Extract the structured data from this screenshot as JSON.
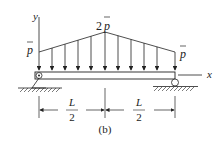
{
  "figure": {
    "caption": "(b)",
    "axes": {
      "y_label": "y",
      "x_label": "x"
    },
    "loads": {
      "left_label": "p",
      "peak_label_coef": "2",
      "peak_label_var": "p",
      "right_label": "p"
    },
    "dimensions": [
      {
        "num": "L",
        "den": "2"
      },
      {
        "num": "L",
        "den": "2"
      }
    ],
    "supports": {
      "left": "pin",
      "right": "roller"
    },
    "colors": {
      "line": "#222222",
      "background": "#ffffff"
    }
  }
}
